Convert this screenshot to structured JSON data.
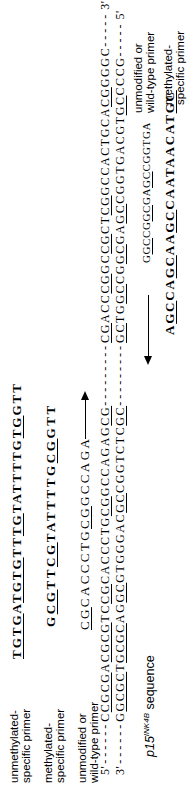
{
  "figure": {
    "forward_primers": [
      {
        "label_line1": "unmethylated-",
        "label_line2": "specific primer",
        "seq": [
          {
            "t": "TGTG",
            "u": true
          },
          {
            "t": "A"
          },
          {
            "t": "TGTG",
            "u": true
          },
          {
            "t": "TT"
          },
          {
            "t": "TG",
            "u": true
          },
          {
            "t": "TATTTTG"
          },
          {
            "t": "TG",
            "u": true
          },
          {
            "t": "GTT"
          }
        ]
      },
      {
        "label_line1": "methylated-",
        "label_line2": "specific primer",
        "seq": [
          {
            "t": "G"
          },
          {
            "t": "CG",
            "u": true
          },
          {
            "t": "TT"
          },
          {
            "t": "CG",
            "u": true
          },
          {
            "t": "TATTTTG"
          },
          {
            "t": "CG",
            "u": true
          },
          {
            "t": "GTT"
          }
        ]
      },
      {
        "label_line1": "unmodified or",
        "label_line2": "wild-type primer",
        "seq": [
          {
            "t": "CG",
            "u": true
          },
          {
            "t": "CACCCTG"
          },
          {
            "t": "CG",
            "u": true
          },
          {
            "t": "GCCAGA"
          }
        ]
      }
    ],
    "duplex": {
      "dash_lead": "------",
      "dash_mid": "---------",
      "dash_tail": "-----",
      "top": {
        "left_end": "5'",
        "right_end": "3'",
        "seq1": [
          {
            "t": "C"
          },
          {
            "t": "CGCG",
            "u": true
          },
          {
            "t": "A"
          },
          {
            "t": "CGCG",
            "u": true
          },
          {
            "t": "TC"
          },
          {
            "t": "CG",
            "u": true
          },
          {
            "t": "CACCCTG"
          },
          {
            "t": "CG",
            "u": true
          },
          {
            "t": "GCCAGAG"
          },
          {
            "t": "CG",
            "u": true
          }
        ],
        "seq2": [
          {
            "t": "CG",
            "u": true
          },
          {
            "t": "ACC"
          },
          {
            "t": "CG",
            "u": true
          },
          {
            "t": "GC"
          },
          {
            "t": "CG",
            "u": true
          },
          {
            "t": "CT"
          },
          {
            "t": "CG",
            "u": true
          },
          {
            "t": "GCCACTGCA"
          },
          {
            "t": "CG",
            "u": true
          },
          {
            "t": "GGGC"
          }
        ]
      },
      "bottom": {
        "left_end": "3'",
        "right_end": "5'",
        "seq1": [
          {
            "t": "G"
          },
          {
            "t": "GCGC",
            "u": true
          },
          {
            "t": "T"
          },
          {
            "t": "GCGC",
            "u": true
          },
          {
            "t": "AG"
          },
          {
            "t": "GC",
            "u": true
          },
          {
            "t": "GTGGGAC"
          },
          {
            "t": "GC",
            "u": true
          },
          {
            "t": "CGGTCTC"
          },
          {
            "t": "GC",
            "u": true
          }
        ],
        "seq2": [
          {
            "t": "GC",
            "u": true
          },
          {
            "t": "TG"
          },
          {
            "t": "GC",
            "u": true
          },
          {
            "t": "CG"
          },
          {
            "t": "GC",
            "u": true
          },
          {
            "t": "GA"
          },
          {
            "t": "GC",
            "u": true
          },
          {
            "t": "CGGTGACGT"
          },
          {
            "t": "GC",
            "u": true
          },
          {
            "t": "CCCG"
          }
        ]
      }
    },
    "gene_label": {
      "gene": "p15",
      "sup": "INK4B",
      "rest": " sequence"
    },
    "reverse_primers": [
      {
        "label_line1": "unmodified or",
        "label_line2": "wild-type primer",
        "seq": [
          {
            "t": "G"
          },
          {
            "t": "GC",
            "u": true
          },
          {
            "t": "CG"
          },
          {
            "t": "GC",
            "u": true
          },
          {
            "t": "GA"
          },
          {
            "t": "GC",
            "u": true
          },
          {
            "t": "CGGTGA"
          }
        ]
      },
      {
        "label_line1": "methylated-",
        "label_line2": "specific primer",
        "seq": [
          {
            "t": "A"
          },
          {
            "t": "GC",
            "u": true
          },
          {
            "t": "CA"
          },
          {
            "t": "GC",
            "u": true
          },
          {
            "t": "AA"
          },
          {
            "t": "GC",
            "u": true
          },
          {
            "t": "CAATAACAT"
          },
          {
            "t": "GC",
            "u": true
          }
        ]
      }
    ]
  }
}
